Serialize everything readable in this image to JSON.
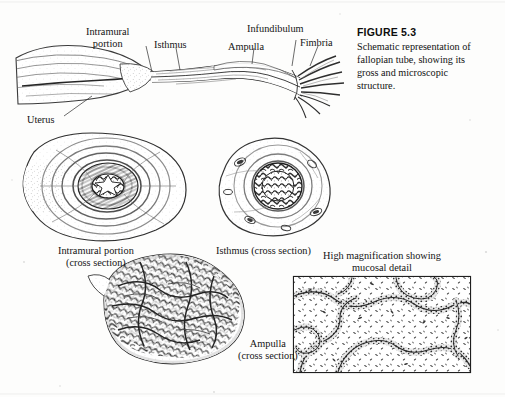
{
  "figure": {
    "number_label": "FIGURE  5.3",
    "caption": "Schematic representation of fallopian tube, showing its gross and microscopic structure."
  },
  "gross_diagram": {
    "labels": [
      {
        "id": "intramural-portion",
        "line1": "Intramural",
        "line2": "portion"
      },
      {
        "id": "isthmus",
        "line1": "Isthmus",
        "line2": ""
      },
      {
        "id": "ampulla",
        "line1": "Ampulla",
        "line2": ""
      },
      {
        "id": "infundibulum",
        "line1": "Infundibulum",
        "line2": ""
      },
      {
        "id": "fimbria",
        "line1": "Fimbria",
        "line2": ""
      },
      {
        "id": "uterus",
        "line1": "Uterus",
        "line2": ""
      }
    ]
  },
  "cross_sections": [
    {
      "id": "intramural-cross-section",
      "line1": "Intramural portion",
      "line2": "(cross section)"
    },
    {
      "id": "isthmus-cross-section",
      "line1": "Isthmus (cross section)",
      "line2": ""
    },
    {
      "id": "ampulla-cross-section",
      "line1": "Ampulla",
      "line2": "(cross section)"
    }
  ],
  "inset": {
    "title_line1": "High magnification showing",
    "title_line2": "mucosal detail"
  },
  "colors": {
    "ink": "#1a1a1a",
    "paper": "#fdfdfc",
    "wash": "#8d8d8d"
  }
}
